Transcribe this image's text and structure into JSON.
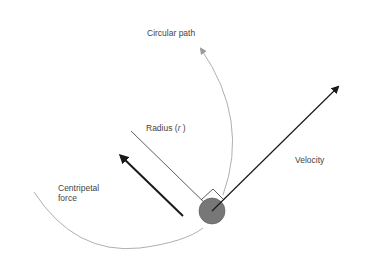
{
  "diagram": {
    "labels": {
      "circular_path": "Circular path",
      "radius_prefix": "Radius (",
      "radius_symbol": "r",
      "radius_suffix": " )",
      "velocity": "Velocity",
      "centripetal_line1": "Centripetal",
      "centripetal_line2": "force"
    },
    "colors": {
      "path": "#9a9a9a",
      "arrow": "#1a1a1a",
      "radius_line": "#333333",
      "ball_fill": "#777777",
      "ball_stroke": "#555555",
      "text": "#444444"
    }
  }
}
